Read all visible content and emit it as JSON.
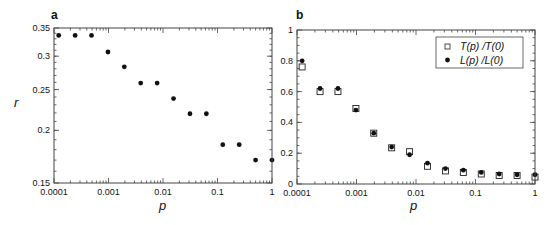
{
  "chart_data": [
    {
      "panel": "a",
      "type": "scatter",
      "title": "",
      "xlabel": "p",
      "ylabel": "r",
      "xscale": "log",
      "yscale": "log",
      "xlim": [
        0.0001,
        1
      ],
      "ylim": [
        0.15,
        0.35
      ],
      "xticks": [
        "0.0001",
        "0.001",
        "0.01",
        "0.1",
        "1"
      ],
      "yticks": [
        "0.35",
        "0.3",
        "0.25",
        "0.2",
        "0.15"
      ],
      "grid": false,
      "series": [
        {
          "name": "r",
          "marker": "filled-circle",
          "x": [
            0.000122,
            0.000244,
            0.000488,
            0.000977,
            0.00195,
            0.0039,
            0.0078,
            0.0156,
            0.03125,
            0.0625,
            0.125,
            0.25,
            0.5,
            1
          ],
          "y": [
            0.336,
            0.336,
            0.336,
            0.307,
            0.283,
            0.259,
            0.259,
            0.238,
            0.219,
            0.219,
            0.185,
            0.185,
            0.17,
            0.17
          ]
        }
      ]
    },
    {
      "panel": "b",
      "type": "scatter",
      "title": "",
      "xlabel": "p",
      "ylabel": "",
      "xscale": "log",
      "yscale": "linear",
      "xlim": [
        0.0001,
        1
      ],
      "ylim": [
        0,
        1
      ],
      "xticks": [
        "0.0001",
        "0.001",
        "0.01",
        "0.1",
        "1"
      ],
      "yticks": [
        "1",
        "0.8",
        "0.6",
        "0.4",
        "0.2",
        "0"
      ],
      "grid": false,
      "legend_position": "upper right",
      "series": [
        {
          "name": "T(p) /T(0)",
          "marker": "open-square",
          "x": [
            0.000122,
            0.000244,
            0.000488,
            0.000977,
            0.00195,
            0.0039,
            0.0078,
            0.0156,
            0.03125,
            0.0625,
            0.125,
            0.25,
            0.5,
            1
          ],
          "y": [
            0.76,
            0.6,
            0.6,
            0.49,
            0.33,
            0.235,
            0.21,
            0.115,
            0.085,
            0.075,
            0.065,
            0.055,
            0.055,
            0.045
          ]
        },
        {
          "name": "L(p) /L(0)",
          "marker": "filled-circle",
          "x": [
            0.000122,
            0.000244,
            0.000488,
            0.000977,
            0.00195,
            0.0039,
            0.0078,
            0.0156,
            0.03125,
            0.0625,
            0.125,
            0.25,
            0.5,
            1
          ],
          "y": [
            0.8,
            0.62,
            0.62,
            0.48,
            0.33,
            0.24,
            0.19,
            0.135,
            0.1,
            0.09,
            0.075,
            0.065,
            0.06,
            0.06
          ]
        }
      ]
    }
  ],
  "panels": {
    "a": {
      "label": "a",
      "xlabel": "p",
      "ylabel": "r"
    },
    "b": {
      "label": "b",
      "xlabel": "p",
      "legend": [
        "T(p) /T(0)",
        "L(p) /L(0)"
      ]
    }
  }
}
